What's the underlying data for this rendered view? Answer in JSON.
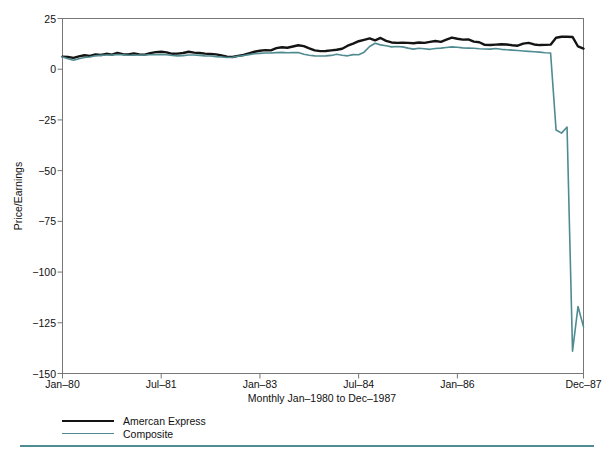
{
  "figure": {
    "background_color": "#ffffff",
    "frame_color": "#6f6f6f",
    "accent_color": "#4f8b90",
    "series_colors": [
      "#141414",
      "#4f8b90"
    ]
  },
  "axis": {
    "y_title": "Price/Earnings",
    "x_title": "Monthly Jan–1980 to Dec–1987",
    "y_ticks": [
      "25",
      "0",
      "−25",
      "−50",
      "−75",
      "−100",
      "−125",
      "−150"
    ],
    "y_tick_values": [
      25,
      0,
      -25,
      -50,
      -75,
      -100,
      -125,
      -150
    ],
    "x_ticks": [
      "Jan–80",
      "Jul–81",
      "Jan–83",
      "Jul–84",
      "Jan–86",
      "Dec–87"
    ],
    "x_tick_indices": [
      0,
      18,
      36,
      54,
      72,
      95
    ]
  },
  "legend": {
    "position": "below-axis-left",
    "entries": [
      {
        "label": "Amercan Express",
        "color": "#141414"
      },
      {
        "label": "Composite",
        "color": "#4f8b90"
      }
    ]
  },
  "chart_data": {
    "type": "line",
    "title": "",
    "subtitle": "",
    "xlabel": "Monthly Jan–1980 to Dec–1987",
    "ylabel": "Price/Earnings",
    "xlim": [
      0,
      95
    ],
    "ylim": [
      -150,
      25
    ],
    "grid": false,
    "legend_position": "below-plot-left",
    "x_tick_labels": [
      "Jan–80",
      "Jul–81",
      "Jan–83",
      "Jul–84",
      "Jan–86",
      "Dec–87"
    ],
    "x_tick_positions": [
      0,
      18,
      36,
      54,
      72,
      95
    ],
    "y_tick_labels": [
      "25",
      "0",
      "−25",
      "−50",
      "−75",
      "−100",
      "−125",
      "−150"
    ],
    "y_tick_positions": [
      25,
      0,
      -25,
      -50,
      -75,
      -100,
      -125,
      -150
    ],
    "x": [
      0,
      1,
      2,
      3,
      4,
      5,
      6,
      7,
      8,
      9,
      10,
      11,
      12,
      13,
      14,
      15,
      16,
      17,
      18,
      19,
      20,
      21,
      22,
      23,
      24,
      25,
      26,
      27,
      28,
      29,
      30,
      31,
      32,
      33,
      34,
      35,
      36,
      37,
      38,
      39,
      40,
      41,
      42,
      43,
      44,
      45,
      46,
      47,
      48,
      49,
      50,
      51,
      52,
      53,
      54,
      55,
      56,
      57,
      58,
      59,
      60,
      61,
      62,
      63,
      64,
      65,
      66,
      67,
      68,
      69,
      70,
      71,
      72,
      73,
      74,
      75,
      76,
      77,
      78,
      79,
      80,
      81,
      82,
      83,
      84,
      85,
      86,
      87,
      88,
      89,
      90,
      91,
      92,
      93,
      94,
      95
    ],
    "x_labels": [
      "Jan–80",
      "Feb–80",
      "Mar–80",
      "Apr–80",
      "May–80",
      "Jun–80",
      "Jul–80",
      "Aug–80",
      "Sep–80",
      "Oct–80",
      "Nov–80",
      "Dec–80",
      "Jan–81",
      "Feb–81",
      "Mar–81",
      "Apr–81",
      "May–81",
      "Jun–81",
      "Jul–81",
      "Aug–81",
      "Sep–81",
      "Oct–81",
      "Nov–81",
      "Dec–81",
      "Jan–82",
      "Feb–82",
      "Mar–82",
      "Apr–82",
      "May–82",
      "Jun–82",
      "Jul–82",
      "Aug–82",
      "Sep–82",
      "Oct–82",
      "Nov–82",
      "Dec–82",
      "Jan–83",
      "Feb–83",
      "Mar–83",
      "Apr–83",
      "May–83",
      "Jun–83",
      "Jul–83",
      "Aug–83",
      "Sep–83",
      "Oct–83",
      "Nov–83",
      "Dec–83",
      "Jan–84",
      "Feb–84",
      "Mar–84",
      "Apr–84",
      "May–84",
      "Jun–84",
      "Jul–84",
      "Aug–84",
      "Sep–84",
      "Oct–84",
      "Nov–84",
      "Dec–84",
      "Jan–85",
      "Feb–85",
      "Mar–85",
      "Apr–85",
      "May–85",
      "Jun–85",
      "Jul–85",
      "Aug–85",
      "Sep–85",
      "Oct–85",
      "Nov–85",
      "Dec–85",
      "Jan–86",
      "Feb–86",
      "Mar–86",
      "Apr–86",
      "May–86",
      "Jun–86",
      "Jul–86",
      "Aug–86",
      "Sep–86",
      "Oct–86",
      "Nov–86",
      "Dec–86",
      "Jan–87",
      "Feb–87",
      "Mar–87",
      "Apr–87",
      "May–87",
      "Jun–87",
      "Jul–87",
      "Aug–87",
      "Sep–87",
      "Oct–87",
      "Nov–87",
      "Dec–87"
    ],
    "series": [
      {
        "name": "Amercan Express",
        "color": "#141414",
        "line_width": 2.4,
        "values": [
          6.2,
          6.0,
          5.6,
          6.3,
          6.9,
          6.6,
          7.3,
          7.0,
          7.6,
          7.2,
          8.0,
          7.4,
          7.3,
          7.8,
          7.3,
          7.2,
          7.9,
          8.4,
          8.6,
          8.3,
          7.6,
          7.7,
          8.0,
          8.6,
          8.2,
          8.0,
          7.7,
          7.5,
          7.3,
          6.8,
          6.2,
          6.0,
          6.6,
          7.0,
          7.8,
          8.6,
          9.1,
          9.4,
          9.3,
          10.4,
          10.8,
          10.6,
          11.2,
          11.8,
          11.4,
          10.3,
          9.3,
          8.9,
          9.0,
          9.3,
          9.6,
          10.1,
          11.6,
          12.6,
          13.8,
          14.5,
          15.2,
          14.2,
          15.4,
          14.0,
          13.2,
          13.0,
          13.1,
          13.0,
          12.8,
          13.2,
          13.0,
          13.5,
          13.9,
          13.5,
          14.6,
          15.6,
          15.0,
          14.6,
          14.7,
          13.6,
          13.3,
          12.0,
          11.9,
          12.1,
          12.3,
          12.2,
          11.8,
          11.6,
          12.6,
          13.0,
          12.2,
          11.9,
          12.0,
          12.1,
          15.5,
          16.0,
          16.0,
          15.9,
          11.2,
          10.2
        ]
      },
      {
        "name": "Composite",
        "color": "#4f8b90",
        "line_width": 1.6,
        "values": [
          6.0,
          5.2,
          4.4,
          5.2,
          5.8,
          6.0,
          6.6,
          6.8,
          7.0,
          7.0,
          7.2,
          7.1,
          6.9,
          6.9,
          7.0,
          7.0,
          7.1,
          7.2,
          7.2,
          7.1,
          6.8,
          6.6,
          6.7,
          7.0,
          7.0,
          6.8,
          6.6,
          6.5,
          6.2,
          6.0,
          5.8,
          5.9,
          6.4,
          6.8,
          7.2,
          7.6,
          7.8,
          8.0,
          8.0,
          8.2,
          8.3,
          8.1,
          8.2,
          8.2,
          7.4,
          6.9,
          6.6,
          6.5,
          6.6,
          6.8,
          7.4,
          6.9,
          6.6,
          7.2,
          7.1,
          8.4,
          11.2,
          12.8,
          12.0,
          11.6,
          11.0,
          11.2,
          11.0,
          10.4,
          9.9,
          10.3,
          10.1,
          9.8,
          10.2,
          10.4,
          10.7,
          11.0,
          10.8,
          10.5,
          10.4,
          10.3,
          10.1,
          10.0,
          9.9,
          10.2,
          9.8,
          9.6,
          9.4,
          9.2,
          9.0,
          8.8,
          8.6,
          8.4,
          8.1,
          8.0,
          -30.0,
          -31.5,
          -28.5,
          -139.0,
          -117.0,
          -127.0
        ]
      }
    ],
    "annotations": [
      {
        "text": "Composite series drops sharply to approximately −139 near Oct–1987",
        "x_label": "Oct–87",
        "y": -139
      }
    ]
  }
}
